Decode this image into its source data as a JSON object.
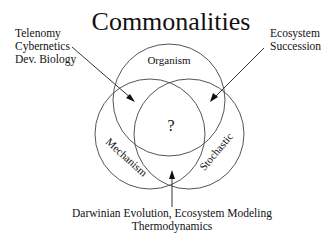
{
  "title": "Commonalities",
  "circles": {
    "top": "Organism",
    "left": "Mechanism",
    "right": "Stochastic"
  },
  "center_label": "?",
  "annotations": {
    "top_left": [
      "Telenomy",
      "Cybernetics",
      "Dev. Biology"
    ],
    "top_right": [
      "Ecosystem",
      "Succession"
    ],
    "bottom": [
      "Darwinian Evolution, Ecosystem Modeling",
      "Thermodynamics"
    ]
  },
  "colors": {
    "circle_stroke": "#555555",
    "text": "#111111",
    "background": "#ffffff"
  }
}
